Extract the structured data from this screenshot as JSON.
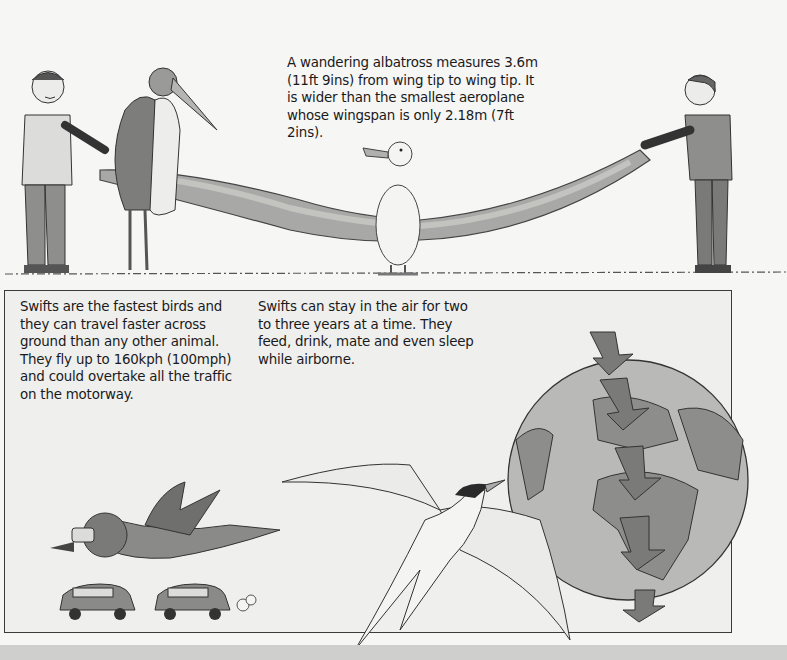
{
  "albatross_panel": {
    "caption": "A wandering albatross measures 3.6m (11ft 9ins) from wing tip to wing tip. It is wider than the smallest aeroplane whose wingspan is only 2.18m (7ft 2ins).",
    "illustrations": [
      "boy-left",
      "marabou-stork",
      "albatross-wing",
      "albatross",
      "boy-right",
      "grass-ground"
    ]
  },
  "swift_box": {
    "speed_caption": "Swifts are the fastest birds and they can travel faster across ground than any other animal. They fly up to 160kph (100mph) and could overtake all the traffic on the motorway.",
    "airborne_caption": "Swifts can stay in the air for two to three years at a time. They feed, drink, mate and even sleep while airborne.",
    "illustrations": [
      "swift-with-helmet",
      "cars",
      "tern",
      "globe",
      "migration-arrows"
    ]
  },
  "colors": {
    "page": "#f6f6f5",
    "box": "#efefee",
    "border": "#3a3a3a",
    "wing": "#a8a8a6",
    "globe_sea": "#b9b9b7",
    "land": "#8d8d8b",
    "arrow": "#7a7a78",
    "strip": "#cfcfcd"
  }
}
